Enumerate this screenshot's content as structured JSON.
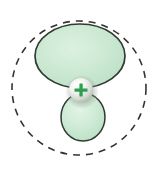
{
  "figure": {
    "name": "hybrid-orbital-diagram",
    "background_color": "#ffffff",
    "caption": "",
    "boundary": {
      "label": "boundary-surface",
      "style": "dashed",
      "stroke_color": "#33332e",
      "cx": 79,
      "cy": 88,
      "r": 67,
      "dash": "7 6",
      "stroke_width": 1.6
    },
    "lobes": [
      {
        "label": "major-lobe",
        "sign": "+",
        "fill_color": "#cbe8d2",
        "stroke_color": "#2f3a30",
        "cx": 80,
        "cy": 56,
        "rx": 45,
        "ry": 32
      },
      {
        "label": "minor-lobe",
        "sign": "-",
        "fill_color": "#cbe8d2",
        "stroke_color": "#2f3a30",
        "cx": 83,
        "cy": 117,
        "rx": 22,
        "ry": 24
      }
    ],
    "nucleus": {
      "label": "nucleus-sphere",
      "charge_symbol": "+",
      "charge_color": "#2f9e4f",
      "highlight_color": "#ffffff",
      "base_color": "#b9c4b8",
      "cx": 81,
      "cy": 90,
      "r": 12
    }
  }
}
